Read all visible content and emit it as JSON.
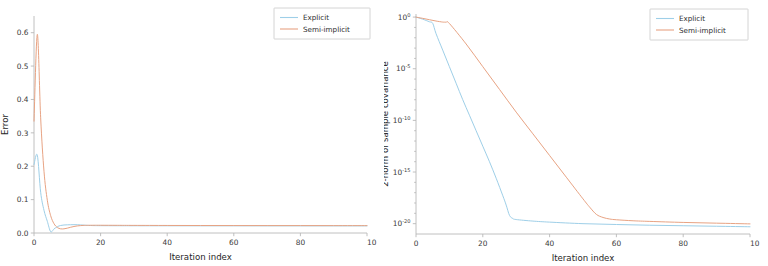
{
  "figure": {
    "background": "#ffffff",
    "panels": 2
  },
  "colors": {
    "explicit": "#9ecfe8",
    "semi_implicit": "#e8a383",
    "axis": "#b9b9b9",
    "text": "#2e2e2e",
    "legend_border": "#c9c9c9"
  },
  "chart_data": [
    {
      "type": "line",
      "panel": "left",
      "title": "",
      "xlabel": "Iteration index",
      "ylabel": "Error",
      "xlim": [
        0,
        100
      ],
      "ylim": [
        0.0,
        0.65
      ],
      "xticks": [
        0,
        20,
        40,
        60,
        80,
        100
      ],
      "xticklabels": [
        "0",
        "20",
        "40",
        "60",
        "80",
        "10"
      ],
      "yticks": [
        0.0,
        0.1,
        0.2,
        0.3,
        0.4,
        0.5,
        0.6
      ],
      "yticklabels": [
        "0.0",
        "0.1",
        "0.2",
        "0.3",
        "0.4",
        "0.5",
        "0.6"
      ],
      "yscale": "linear",
      "grid": false,
      "legend_position": "upper right",
      "legend_entries": [
        "Explicit",
        "Semi-implicit"
      ],
      "series": [
        {
          "name": "Explicit",
          "color": "#9ecfe8",
          "x": [
            0,
            1,
            2,
            3,
            4,
            5,
            6,
            7,
            8,
            9,
            10,
            11,
            12,
            13,
            14,
            15,
            16,
            18,
            20,
            25,
            30,
            40,
            50,
            60,
            70,
            80,
            90,
            100
          ],
          "values": [
            0.205,
            0.233,
            0.122,
            0.068,
            0.035,
            0.004,
            0.012,
            0.019,
            0.0225,
            0.024,
            0.0245,
            0.0248,
            0.025,
            0.0248,
            0.0242,
            0.0235,
            0.0228,
            0.0222,
            0.022,
            0.0218,
            0.0217,
            0.0216,
            0.0215,
            0.0215,
            0.0214,
            0.0214,
            0.0213,
            0.0213
          ]
        },
        {
          "name": "Semi-implicit",
          "color": "#e8a383",
          "x": [
            0,
            1,
            2,
            3,
            4,
            5,
            6,
            7,
            8,
            9,
            10,
            11,
            12,
            13,
            14,
            15,
            16,
            18,
            20,
            25,
            30,
            40,
            50,
            60,
            70,
            80,
            90,
            100
          ],
          "values": [
            0.335,
            0.595,
            0.345,
            0.185,
            0.098,
            0.052,
            0.028,
            0.0165,
            0.0125,
            0.0125,
            0.0145,
            0.0172,
            0.0195,
            0.0212,
            0.0222,
            0.0228,
            0.023,
            0.0232,
            0.0232,
            0.023,
            0.0228,
            0.0226,
            0.0224,
            0.0223,
            0.0222,
            0.0222,
            0.0221,
            0.0221
          ]
        }
      ]
    },
    {
      "type": "line",
      "panel": "right",
      "title": "",
      "xlabel": "Iteration index",
      "ylabel": "2-norm of sample covariance",
      "xlim": [
        0,
        100
      ],
      "ylim": [
        1e-21,
        2.0
      ],
      "xticks": [
        0,
        20,
        40,
        60,
        80,
        100
      ],
      "xticklabels": [
        "0",
        "20",
        "40",
        "60",
        "80",
        "10"
      ],
      "yticks": [
        1,
        1e-05,
        1e-10,
        1e-15,
        1e-20
      ],
      "yticklabels": [
        "10^0",
        "10^-5",
        "10^-10",
        "10^-15",
        "10^-20"
      ],
      "yscale": "log",
      "grid": false,
      "legend_position": "upper right",
      "legend_entries": [
        "Explicit",
        "Semi-implicit"
      ],
      "series": [
        {
          "name": "Explicit",
          "color": "#9ecfe8",
          "x": [
            0,
            2,
            4,
            5,
            6,
            8,
            10,
            12,
            14,
            16,
            18,
            20,
            22,
            24,
            26,
            27,
            28,
            29,
            30,
            35,
            40,
            50,
            60,
            70,
            80,
            90,
            100
          ],
          "log10_values": [
            0.0,
            -0.2,
            -0.45,
            -0.6,
            -1.6,
            -3.2,
            -4.8,
            -6.4,
            -8.0,
            -9.5,
            -11.0,
            -12.5,
            -14.0,
            -15.6,
            -17.3,
            -18.2,
            -19.2,
            -19.5,
            -19.6,
            -19.75,
            -19.85,
            -20.0,
            -20.08,
            -20.15,
            -20.2,
            -20.25,
            -20.3
          ]
        },
        {
          "name": "Semi-implicit",
          "color": "#e8a383",
          "x": [
            0,
            2,
            4,
            6,
            8,
            9,
            10,
            15,
            20,
            25,
            30,
            35,
            40,
            45,
            50,
            52,
            54,
            56,
            58,
            60,
            65,
            70,
            80,
            90,
            100
          ],
          "log10_values": [
            0.0,
            -0.12,
            -0.25,
            -0.38,
            -0.48,
            -0.5,
            -0.62,
            -2.6,
            -4.8,
            -7.0,
            -9.2,
            -11.3,
            -13.4,
            -15.5,
            -17.6,
            -18.4,
            -19.1,
            -19.4,
            -19.55,
            -19.62,
            -19.72,
            -19.78,
            -19.88,
            -19.95,
            -20.02
          ]
        }
      ]
    }
  ]
}
